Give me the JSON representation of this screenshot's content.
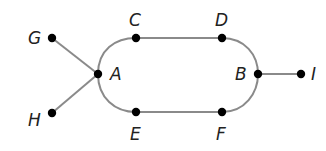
{
  "diagram": {
    "type": "graph",
    "edge_color": "#8a8a8a",
    "node_color": "#000000",
    "nodes": [
      {
        "id": "A",
        "label": "A",
        "x": 98,
        "y": 74,
        "lx": 110,
        "ly": 80
      },
      {
        "id": "B",
        "label": "B",
        "x": 258,
        "y": 74,
        "lx": 235,
        "ly": 80
      },
      {
        "id": "C",
        "label": "C",
        "x": 136,
        "y": 38,
        "lx": 129,
        "ly": 26
      },
      {
        "id": "D",
        "label": "D",
        "x": 222,
        "y": 38,
        "lx": 215,
        "ly": 26
      },
      {
        "id": "E",
        "label": "E",
        "x": 136,
        "y": 112,
        "lx": 130,
        "ly": 140
      },
      {
        "id": "F",
        "label": "F",
        "x": 222,
        "y": 112,
        "lx": 216,
        "ly": 140
      },
      {
        "id": "G",
        "label": "G",
        "x": 52,
        "y": 38,
        "lx": 28,
        "ly": 44
      },
      {
        "id": "H",
        "label": "H",
        "x": 52,
        "y": 113,
        "lx": 28,
        "ly": 126
      },
      {
        "id": "I",
        "label": "I",
        "x": 301,
        "y": 74,
        "lx": 311,
        "ly": 80
      }
    ],
    "edges": [
      [
        "G",
        "A"
      ],
      [
        "H",
        "A"
      ],
      [
        "A",
        "C"
      ],
      [
        "C",
        "D"
      ],
      [
        "D",
        "B"
      ],
      [
        "A",
        "E"
      ],
      [
        "E",
        "F"
      ],
      [
        "F",
        "B"
      ],
      [
        "B",
        "I"
      ]
    ]
  }
}
